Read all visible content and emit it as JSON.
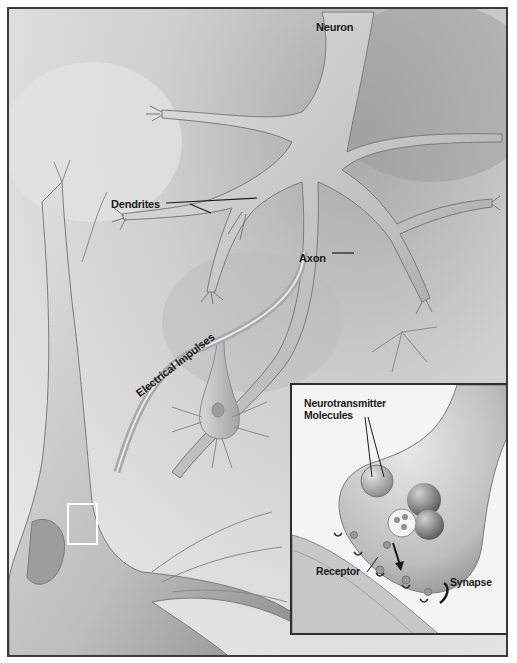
{
  "figure": {
    "labels": {
      "neuron": "Neuron",
      "dendrites": "Dendrites",
      "axon": "Axon",
      "electrical_impulses": "Electrical Impulses"
    },
    "inset": {
      "labels": {
        "neurotransmitter_line1": "Neurotransmitter",
        "neurotransmitter_line2": "Molecules",
        "receptor": "Receptor",
        "synapse": "Synapse"
      }
    },
    "colors": {
      "background": "#d9d9d9",
      "frame_border": "#3a3a3a",
      "cell_body": "#c4c4c4",
      "cell_shadow": "#8a8a8a",
      "inset_background": "#f4f4f4",
      "label_text": "#1a1a1a"
    }
  }
}
